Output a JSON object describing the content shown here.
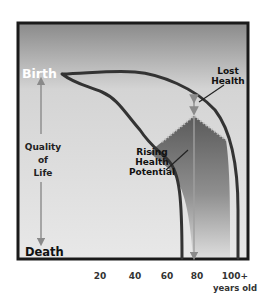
{
  "diagram": {
    "y_axis": {
      "top_label": "Birth",
      "middle_label_lines": [
        "Quality",
        "of",
        "Life"
      ],
      "bottom_label": "Death"
    },
    "x_axis": {
      "ticks": [
        "20",
        "40",
        "60",
        "80",
        "100+"
      ],
      "unit_label": "years old"
    },
    "annotations": {
      "lost_health": [
        "Lost",
        "Health"
      ],
      "rising_health_potential": [
        "Rising",
        "Health",
        "Potential"
      ]
    },
    "colors": {
      "frame": "#1a1a1a",
      "background_top": "#8c8c8c",
      "background_bottom": "#e6e6e6",
      "curve": "#3a3a3a",
      "shaded_region_top": "#5e5e5e",
      "shaded_region_bottom": "#d8d8d8",
      "arrow": "#8a8a8a",
      "birth_text": "#ffffff",
      "label_text": "#222222"
    }
  }
}
